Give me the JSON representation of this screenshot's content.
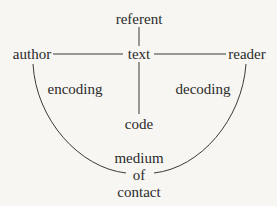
{
  "diagram": {
    "nodes": {
      "referent": "referent",
      "author": "author",
      "text": "text",
      "reader": "reader",
      "code": "code",
      "encoding": "encoding",
      "decoding": "decoding",
      "medium_line1": "medium",
      "medium_line2": "of",
      "medium_line3": "contact"
    },
    "edges": [
      {
        "from": "referent",
        "to": "text"
      },
      {
        "from": "author",
        "to": "text"
      },
      {
        "from": "text",
        "to": "reader"
      },
      {
        "from": "text",
        "to": "code"
      },
      {
        "from": "author",
        "to": "medium of contact",
        "shape": "arc"
      },
      {
        "from": "medium of contact",
        "to": "reader",
        "shape": "arc"
      }
    ],
    "colors": {
      "background": "#f7f6f3",
      "ink": "#2a2a2a"
    }
  }
}
